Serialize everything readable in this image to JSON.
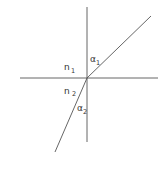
{
  "diagram": {
    "colors": {
      "background": "#ffffff",
      "line": "#555555",
      "text": "#333333"
    },
    "geometry": {
      "origin": [
        87,
        78
      ],
      "normal": {
        "x": 87,
        "y1": 7,
        "y2": 142
      },
      "interface": {
        "y": 78,
        "x1": 20,
        "x2": 158
      },
      "incident_ray": {
        "from": [
          151,
          16
        ],
        "to": [
          87,
          78
        ]
      },
      "refracted_ray": {
        "from": [
          87,
          78
        ],
        "to": [
          55,
          152
        ]
      }
    },
    "labels": {
      "n1": {
        "base": "n",
        "sub": "1"
      },
      "n2": {
        "base": "n",
        "sub": "2"
      },
      "alpha1": {
        "base": "α",
        "sub": "1"
      },
      "alpha2": {
        "base": "α",
        "sub": "2"
      }
    }
  }
}
